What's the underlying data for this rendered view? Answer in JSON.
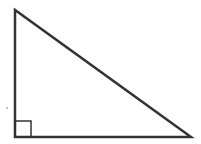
{
  "diagram": {
    "shape": "right-triangle",
    "stroke_color": "#333333",
    "background": "#ffffff",
    "vertices": {
      "top": [
        15,
        10
      ],
      "right_angle": [
        15,
        137
      ],
      "bottom_right": [
        191,
        137
      ]
    },
    "right_angle_marker": {
      "x": 15,
      "y": 121,
      "size": 16
    },
    "dot": [
      7,
      108
    ]
  }
}
